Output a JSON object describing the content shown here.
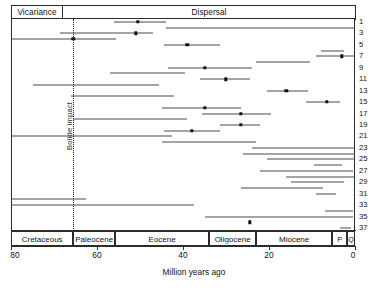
{
  "header": {
    "vicariance_label": "Vicariance",
    "dispersal_label": "Dispersal"
  },
  "annotations": {
    "bolide_label": "Bolide impact",
    "bolide_age": 65.5
  },
  "axis": {
    "xlabel": "Million years ago",
    "xlim": [
      80,
      0
    ],
    "ticks": [
      80,
      60,
      40,
      20,
      0
    ],
    "tick_labels": [
      "80",
      "60",
      "40",
      "20",
      "0"
    ]
  },
  "epochs": [
    {
      "name": "Cretaceous",
      "start": 80,
      "end": 65.5
    },
    {
      "name": "Paleocene",
      "start": 65.5,
      "end": 55.8
    },
    {
      "name": "Eocene",
      "start": 55.8,
      "end": 33.9
    },
    {
      "name": "Oligocene",
      "start": 33.9,
      "end": 23.0
    },
    {
      "name": "Miocene",
      "start": 23.0,
      "end": 5.3
    },
    {
      "name": "P",
      "start": 5.3,
      "end": 1.8
    },
    {
      "name": "Q",
      "start": 1.8,
      "end": 0
    }
  ],
  "row_labels": [
    "1",
    "3",
    "5",
    "7",
    "9",
    "11",
    "13",
    "15",
    "17",
    "19",
    "21",
    "23",
    "25",
    "27",
    "29",
    "31",
    "33",
    "35",
    "37"
  ],
  "chart_data": {
    "type": "scatter",
    "title": "",
    "xlabel": "Million years ago",
    "ylabel": "",
    "xlim": [
      80,
      0
    ],
    "grid": false,
    "legend": "none",
    "rows": [
      {
        "id": 1,
        "low": 56.0,
        "high": 44.0,
        "estimate": 50.5
      },
      {
        "id": 2,
        "low": 44.0,
        "high": 0.0,
        "estimate": null
      },
      {
        "id": 3,
        "low": 68.5,
        "high": 47.0,
        "estimate": 51.0
      },
      {
        "id": 4,
        "low": 80.0,
        "high": 55.5,
        "estimate": 65.5
      },
      {
        "id": 5,
        "low": 44.5,
        "high": 31.5,
        "estimate": 39.0
      },
      {
        "id": 6,
        "low": 8.0,
        "high": 2.5,
        "estimate": null
      },
      {
        "id": 7,
        "low": 9.0,
        "high": 0.0,
        "estimate": 3.0
      },
      {
        "id": 8,
        "low": 23.0,
        "high": 10.5,
        "estimate": null
      },
      {
        "id": 9,
        "low": 43.5,
        "high": 24.0,
        "estimate": 35.0
      },
      {
        "id": 10,
        "low": 57.0,
        "high": 39.5,
        "estimate": null
      },
      {
        "id": 11,
        "low": 36.0,
        "high": 24.5,
        "estimate": 30.0
      },
      {
        "id": 12,
        "low": 75.0,
        "high": 45.5,
        "estimate": null
      },
      {
        "id": 13,
        "low": 20.5,
        "high": 11.0,
        "estimate": 16.0
      },
      {
        "id": 14,
        "low": 66.0,
        "high": 42.0,
        "estimate": null
      },
      {
        "id": 15,
        "low": 11.5,
        "high": 3.5,
        "estimate": 6.5
      },
      {
        "id": 16,
        "low": 45.0,
        "high": 26.5,
        "estimate": 35.0
      },
      {
        "id": 17,
        "low": 35.5,
        "high": 19.5,
        "estimate": 26.5
      },
      {
        "id": 18,
        "low": 65.5,
        "high": 39.0,
        "estimate": null
      },
      {
        "id": 19,
        "low": 31.5,
        "high": 22.0,
        "estimate": 26.5
      },
      {
        "id": 20,
        "low": 44.5,
        "high": 31.5,
        "estimate": 38.0
      },
      {
        "id": 21,
        "low": 80.0,
        "high": 42.5,
        "estimate": null
      },
      {
        "id": 22,
        "low": 45.0,
        "high": 23.0,
        "estimate": null
      },
      {
        "id": 23,
        "low": 24.0,
        "high": 0.0,
        "estimate": null
      },
      {
        "id": 24,
        "low": 26.0,
        "high": 0.0,
        "estimate": null
      },
      {
        "id": 25,
        "low": 20.5,
        "high": 0.0,
        "estimate": null
      },
      {
        "id": 26,
        "low": 9.5,
        "high": 3.0,
        "estimate": null
      },
      {
        "id": 27,
        "low": 22.0,
        "high": 0.5,
        "estimate": null
      },
      {
        "id": 28,
        "low": 16.0,
        "high": 0.0,
        "estimate": null
      },
      {
        "id": 29,
        "low": 15.0,
        "high": 2.5,
        "estimate": null
      },
      {
        "id": 30,
        "low": 26.5,
        "high": 7.5,
        "estimate": null
      },
      {
        "id": 31,
        "low": 9.0,
        "high": 4.5,
        "estimate": null
      },
      {
        "id": 32,
        "low": 80.0,
        "high": 62.5,
        "estimate": null
      },
      {
        "id": 33,
        "low": 80.0,
        "high": 37.5,
        "estimate": null
      },
      {
        "id": 34,
        "low": 7.0,
        "high": 0.5,
        "estimate": null
      },
      {
        "id": 35,
        "low": 35.0,
        "high": 0.5,
        "estimate": null
      },
      {
        "id": 36,
        "low": 24.5,
        "high": 24.5,
        "estimate": 24.5
      },
      {
        "id": 37,
        "low": 3.5,
        "high": 1.0,
        "estimate": null
      }
    ]
  }
}
